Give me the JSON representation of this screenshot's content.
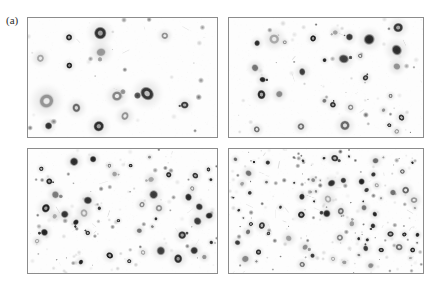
{
  "figure": {
    "label": "(a)",
    "top_clipped_text": "",
    "background_color": "#ffffff",
    "panel_background": "#fdfdfd",
    "panel_border_color": "#8c8c8c",
    "particle_dark_color": "#1f1f1f",
    "particle_mid_color": "#8a8a8a",
    "particle_halo_color": "#cfcfcf"
  },
  "panels": [
    {
      "id": "panel-top-left",
      "position": "top-left",
      "description": "Sparse field of large dark annular particles",
      "particle_count": 14,
      "seed": 11,
      "density": "low",
      "size_min": 3.0,
      "size_max": 8.5,
      "ring_fraction": 0.85,
      "speck_count": 26,
      "speck_max_radius": 1.4
    },
    {
      "id": "panel-top-right",
      "position": "top-right",
      "description": "Moderate field of medium dark annular particles",
      "particle_count": 30,
      "seed": 27,
      "density": "medium",
      "size_min": 2.2,
      "size_max": 6.4,
      "ring_fraction": 0.7,
      "speck_count": 52,
      "speck_max_radius": 1.3
    },
    {
      "id": "panel-bottom-left",
      "position": "bottom-left",
      "description": "Dense field of small dark particles with fine specks",
      "particle_count": 46,
      "seed": 43,
      "density": "high",
      "size_min": 1.6,
      "size_max": 5.0,
      "ring_fraction": 0.45,
      "speck_count": 95,
      "speck_max_radius": 1.2
    },
    {
      "id": "panel-bottom-right",
      "position": "bottom-right",
      "description": "Very dense field of fine dark particles and faint streaks",
      "particle_count": 74,
      "seed": 61,
      "density": "very-high",
      "size_min": 1.2,
      "size_max": 4.6,
      "ring_fraction": 0.3,
      "speck_count": 150,
      "speck_max_radius": 1.1
    }
  ]
}
